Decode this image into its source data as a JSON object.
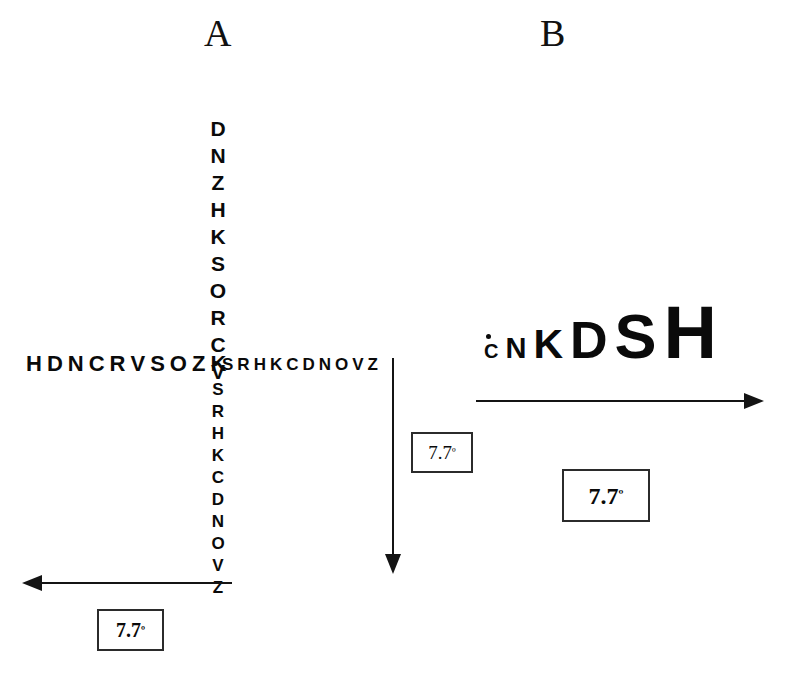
{
  "figure": {
    "background_color": "#ffffff",
    "ink_color": "#0a0a0a",
    "width": 788,
    "height": 675
  },
  "panels": [
    {
      "id": "a",
      "label": "A"
    },
    {
      "id": "b",
      "label": "B"
    }
  ],
  "panel_a": {
    "label": "A",
    "vertical_chart": {
      "upper_letters": [
        "D",
        "N",
        "Z",
        "H",
        "K",
        "S",
        "O",
        "R",
        "C",
        "V"
      ],
      "lower_letters": [
        "S",
        "R",
        "H",
        "K",
        "C",
        "D",
        "N",
        "O",
        "V",
        "Z"
      ],
      "fixation_marker": "·"
    },
    "horizontal_chart": {
      "left_letters": [
        "H",
        "D",
        "N",
        "C",
        "R",
        "V",
        "S",
        "O",
        "Z",
        "K"
      ],
      "right_letters": [
        "S",
        "R",
        "H",
        "K",
        "C",
        "D",
        "N",
        "O",
        "V",
        "Z"
      ],
      "fixation_marker": "·"
    },
    "horizontal_arrow": {
      "direction": "left",
      "label": {
        "value": "7.7",
        "unit": "º",
        "text": "7.7º"
      }
    },
    "vertical_arrow": {
      "direction": "down",
      "label": {
        "value": "7.7",
        "unit": "º",
        "text": "7.7º"
      }
    }
  },
  "panel_b": {
    "label": "B",
    "progressive_chart": {
      "fixation_marker": "·",
      "letters": [
        {
          "char": "C",
          "size_px": 20
        },
        {
          "char": "N",
          "size_px": 29
        },
        {
          "char": "K",
          "size_px": 41
        },
        {
          "char": "D",
          "size_px": 52
        },
        {
          "char": "S",
          "size_px": 63
        },
        {
          "char": "H",
          "size_px": 74
        }
      ]
    },
    "arrow": {
      "direction": "right",
      "label": {
        "value": "7.7",
        "unit": "º",
        "text": "7.7º"
      }
    }
  }
}
